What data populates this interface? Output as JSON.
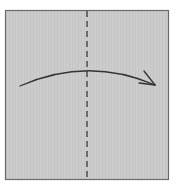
{
  "diagram": {
    "type": "origami-fold-step",
    "paper": {
      "x": 5,
      "y": 10,
      "width": 163,
      "height": 170,
      "fill": "#cccccc",
      "stroke": "#666666"
    },
    "fold_line": {
      "style": "valley-dashed",
      "x": 87,
      "y1": 11,
      "y2": 179,
      "color": "#444444"
    },
    "arrow": {
      "direction": "left-to-right",
      "path": "M20,86 Q88,56 155,85",
      "color": "#333333"
    }
  }
}
